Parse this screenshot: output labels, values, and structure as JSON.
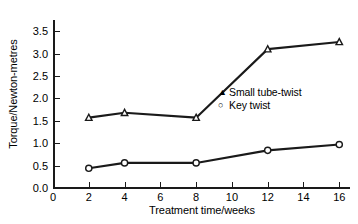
{
  "chart_data": {
    "type": "line",
    "title": "",
    "xlabel": "Treatment time/weeks",
    "ylabel": "Torque/Newton-metres",
    "xlim": [
      0,
      16.6
    ],
    "ylim": [
      0.0,
      3.75
    ],
    "xticks": [
      0,
      2,
      4,
      6,
      8,
      10,
      12,
      14,
      16
    ],
    "xtick_labels": [
      "0",
      "2",
      "4",
      "6",
      "8",
      "10",
      "12",
      "14",
      "16"
    ],
    "yticks": [
      0.0,
      0.5,
      1.0,
      1.5,
      2.0,
      2.5,
      3.0,
      3.5
    ],
    "ytick_labels": [
      "0.0",
      "0.5",
      "1.0",
      "1.5",
      "2.0",
      "2.5",
      "3.0",
      "3.5"
    ],
    "grid": false,
    "legend_position": "inside-right-middle",
    "line_color": "#1a1a1a",
    "x": [
      2,
      4,
      8,
      12,
      16
    ],
    "series": [
      {
        "name": "Small tube-twist",
        "marker": "triangle",
        "marker_glyph": "▲",
        "values": [
          1.57,
          1.68,
          1.57,
          3.1,
          3.26
        ]
      },
      {
        "name": "Key twist",
        "marker": "circle",
        "marker_glyph": "○",
        "values": [
          0.44,
          0.56,
          0.56,
          0.84,
          0.97
        ]
      }
    ]
  }
}
